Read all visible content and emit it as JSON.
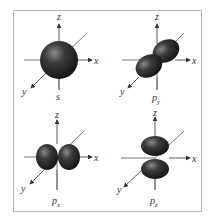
{
  "figure": {
    "panels": [
      {
        "orbital": "s",
        "label_main": "s",
        "label_sub": "",
        "axes": {
          "x": "x",
          "y": "y",
          "z": "z"
        }
      },
      {
        "orbital": "py",
        "label_main": "p",
        "label_sub": "y",
        "axes": {
          "x": "x",
          "y": "y",
          "z": "z"
        }
      },
      {
        "orbital": "px",
        "label_main": "p",
        "label_sub": "x",
        "axes": {
          "x": "x",
          "y": "y",
          "z": "z"
        }
      },
      {
        "orbital": "pz",
        "label_main": "p",
        "label_sub": "z",
        "axes": {
          "x": "x",
          "y": "y",
          "z": "z"
        }
      }
    ],
    "colors": {
      "lobe_dark": "#1a1a1a",
      "lobe_highlight": "#8a8a8a",
      "axis": "#333333",
      "frame": "#b8b8b8"
    }
  }
}
